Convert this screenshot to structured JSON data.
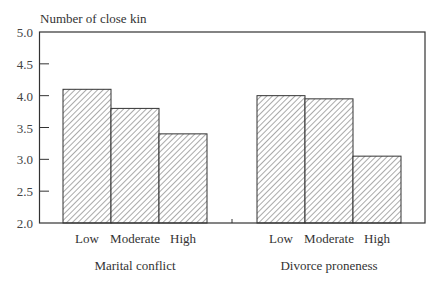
{
  "chart_data": {
    "type": "bar",
    "title": "",
    "ylabel": "Number of close kin",
    "xlabel": "",
    "ylim": [
      2.0,
      5.0
    ],
    "yticks": [
      "2.0",
      "2.5",
      "3.0",
      "3.5",
      "4.0",
      "4.5",
      "5.0"
    ],
    "grid": false,
    "legend": null,
    "groups": [
      {
        "name": "Marital conflict",
        "categories": [
          "Low",
          "Moderate",
          "High"
        ],
        "values": [
          4.1,
          3.8,
          3.4
        ]
      },
      {
        "name": "Divorce proneness",
        "categories": [
          "Low",
          "Moderate",
          "High"
        ],
        "values": [
          4.0,
          3.95,
          3.05
        ]
      }
    ],
    "bar_style": "diagonal-hatch",
    "colors": {
      "axis": "#333333",
      "hatch": "#555555",
      "bar_fill": "#ffffff"
    }
  }
}
